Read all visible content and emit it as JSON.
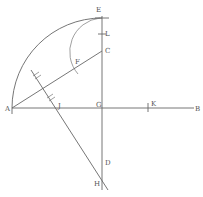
{
  "diagram": {
    "title": "",
    "labels": {
      "A": "A",
      "B": "B",
      "C": "C",
      "D": "D",
      "E": "E",
      "F": "F",
      "G": "G",
      "H": "H",
      "J": "J",
      "K": "K",
      "L": "L"
    }
  }
}
